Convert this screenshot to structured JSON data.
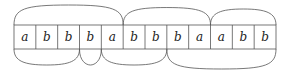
{
  "diagram": {
    "type": "word-with-arc-matching",
    "cells": [
      "a",
      "b",
      "b",
      "b",
      "a",
      "b",
      "b",
      "b",
      "a",
      "a",
      "b",
      "b"
    ],
    "table": {
      "x": 14,
      "y": 25,
      "width": 262,
      "height": 24
    },
    "top_arcs": [
      {
        "from_boundary": 0,
        "to_boundary": 5
      },
      {
        "from_boundary": 5,
        "to_boundary": 9
      },
      {
        "from_boundary": 9,
        "to_boundary": 12
      }
    ],
    "bottom_arcs": [
      {
        "from_boundary": 0,
        "to_boundary": 3
      },
      {
        "from_boundary": 3,
        "to_boundary": 4
      },
      {
        "from_boundary": 4,
        "to_boundary": 7
      },
      {
        "from_boundary": 7,
        "to_boundary": 12
      }
    ],
    "colors": {
      "line": "#555555",
      "text": "#222222",
      "background": "#ffffff"
    }
  }
}
